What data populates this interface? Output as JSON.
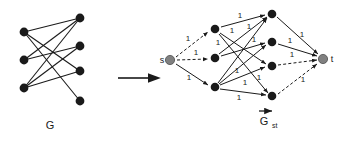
{
  "figure": {
    "title_left": "G",
    "title_right": "G",
    "title_right_subscript": "st",
    "transform_arrow": "right-arrow",
    "vector_accent": "right-arrow-overbar"
  },
  "left_graph": {
    "name": "G",
    "caption": "G",
    "type": "undirected bipartite graph",
    "node_color": "#1a1a1a",
    "edge_color": "#1a1a1a",
    "left_nodes": [
      {
        "id": "u1",
        "x": 24,
        "y": 32
      },
      {
        "id": "u2",
        "x": 24,
        "y": 60
      },
      {
        "id": "u3",
        "x": 24,
        "y": 88
      }
    ],
    "right_nodes": [
      {
        "id": "v1",
        "x": 80,
        "y": 18
      },
      {
        "id": "v2",
        "x": 80,
        "y": 46
      },
      {
        "id": "v3",
        "x": 80,
        "y": 71
      },
      {
        "id": "v4",
        "x": 80,
        "y": 101
      }
    ],
    "edges": [
      {
        "from": "u1",
        "to": "v1"
      },
      {
        "from": "u1",
        "to": "v3"
      },
      {
        "from": "u1",
        "to": "v4"
      },
      {
        "from": "u2",
        "to": "v1"
      },
      {
        "from": "u2",
        "to": "v2"
      },
      {
        "from": "u3",
        "to": "v1"
      },
      {
        "from": "u3",
        "to": "v2"
      },
      {
        "from": "u3",
        "to": "v3"
      }
    ]
  },
  "right_graph": {
    "name": "G_st",
    "caption": "G",
    "caption_subscript": "st",
    "type": "directed flow network",
    "source_label": "s",
    "sink_label": "t",
    "source_color": "#808080",
    "sink_color": "#808080",
    "node_color": "#1a1a1a",
    "edge_color": "#1a1a1a",
    "capacity_value": "1",
    "source": {
      "id": "s",
      "x": 170,
      "y": 60,
      "label": "s"
    },
    "sink": {
      "id": "t",
      "x": 323,
      "y": 59,
      "label": "t"
    },
    "left_nodes": [
      {
        "id": "u1",
        "x": 215,
        "y": 29
      },
      {
        "id": "u2",
        "x": 215,
        "y": 58
      },
      {
        "id": "u3",
        "x": 215,
        "y": 87
      }
    ],
    "right_nodes": [
      {
        "id": "v1",
        "x": 272,
        "y": 14
      },
      {
        "id": "v2",
        "x": 272,
        "y": 42
      },
      {
        "id": "v3",
        "x": 272,
        "y": 66
      },
      {
        "id": "v4",
        "x": 272,
        "y": 96
      }
    ],
    "source_edges": [
      {
        "from": "s",
        "to": "u1",
        "capacity": "1",
        "style": "dashed",
        "label_x": 188,
        "label_y": 41
      },
      {
        "from": "s",
        "to": "u2",
        "capacity": "1",
        "style": "dashed",
        "label_x": 196,
        "label_y": 54
      },
      {
        "from": "s",
        "to": "u3",
        "capacity": "1",
        "style": "solid",
        "label_x": 189,
        "label_y": 79
      }
    ],
    "middle_edges": [
      {
        "from": "u1",
        "to": "v1",
        "capacity": "1",
        "style": "solid",
        "label_x": 240,
        "label_y": 17
      },
      {
        "from": "u1",
        "to": "v3",
        "capacity": "1",
        "style": "solid",
        "label_x": 219,
        "label_y": 44
      },
      {
        "from": "u1",
        "to": "v4",
        "capacity": "1",
        "style": "solid",
        "label_x": 231,
        "label_y": 32
      },
      {
        "from": "u2",
        "to": "v1",
        "capacity": "1",
        "style": "solid",
        "label_x": 250,
        "label_y": 28
      },
      {
        "from": "u2",
        "to": "v2",
        "capacity": "1",
        "style": "solid",
        "label_x": 252,
        "label_y": 41
      },
      {
        "from": "u3",
        "to": "v1",
        "capacity": "1",
        "style": "solid",
        "label_x": 238,
        "label_y": 72
      },
      {
        "from": "u3",
        "to": "v2",
        "capacity": "1",
        "style": "solid",
        "label_x": 258,
        "label_y": 79
      },
      {
        "from": "u3",
        "to": "v3",
        "capacity": "1",
        "style": "solid",
        "label_x": 244,
        "label_y": 84
      },
      {
        "from": "u3",
        "to": "v4",
        "capacity": "1",
        "style": "solid",
        "label_x": 239,
        "label_y": 98
      }
    ],
    "sink_edges": [
      {
        "from": "v1",
        "to": "t",
        "capacity": "1",
        "style": "solid",
        "label_x": 301,
        "label_y": 37
      },
      {
        "from": "v2",
        "to": "t",
        "capacity": "1",
        "style": "solid",
        "label_x": 290,
        "label_y": 42
      },
      {
        "from": "v3",
        "to": "t",
        "capacity": "1",
        "style": "dashed",
        "label_x": 290,
        "label_y": 56
      },
      {
        "from": "v4",
        "to": "t",
        "capacity": "1",
        "style": "dashed",
        "label_x": 302,
        "label_y": 81
      }
    ]
  }
}
